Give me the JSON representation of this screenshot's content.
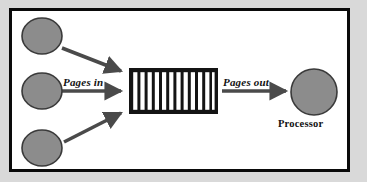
{
  "diagram": {
    "canvas": {
      "width": 367,
      "height": 182,
      "background": "#d9d9d9"
    },
    "frame": {
      "border_color": "#0a0a0a",
      "fill": "#ffffff"
    },
    "colors": {
      "node_fill": "#8c8c8c",
      "node_stroke": "#3a3a3a",
      "arrow": "#4a4a4a",
      "bar_dark": "#141414",
      "bar_light": "#ffffff",
      "text": "#111111"
    },
    "labels": {
      "pages_in": "Pages in",
      "pages_out": "Pages out",
      "processor": "Processor"
    },
    "sources": [
      {
        "name": "source-top",
        "cx": 42,
        "cy": 36,
        "rx": 20,
        "ry": 18
      },
      {
        "name": "source-middle",
        "cx": 42,
        "cy": 91,
        "rx": 20,
        "ry": 18
      },
      {
        "name": "source-bottom",
        "cx": 42,
        "cy": 148,
        "rx": 20,
        "ry": 18
      }
    ],
    "queue": {
      "name": "page-queue-buffer",
      "x": 129,
      "y": 68,
      "width": 89,
      "height": 46,
      "stripe_count": 12
    },
    "processor": {
      "name": "processor-node",
      "cx": 314,
      "cy": 92,
      "r": 23
    },
    "arrows": [
      {
        "name": "arrow-source-top-to-queue",
        "x1": 62,
        "y1": 48,
        "x2": 124,
        "y2": 72
      },
      {
        "name": "arrow-source-middle-to-queue",
        "x1": 62,
        "y1": 91,
        "x2": 124,
        "y2": 91
      },
      {
        "name": "arrow-source-bottom-to-queue",
        "x1": 64,
        "y1": 142,
        "x2": 124,
        "y2": 112
      },
      {
        "name": "arrow-queue-to-processor",
        "x1": 222,
        "y1": 91,
        "x2": 288,
        "y2": 91
      }
    ]
  }
}
